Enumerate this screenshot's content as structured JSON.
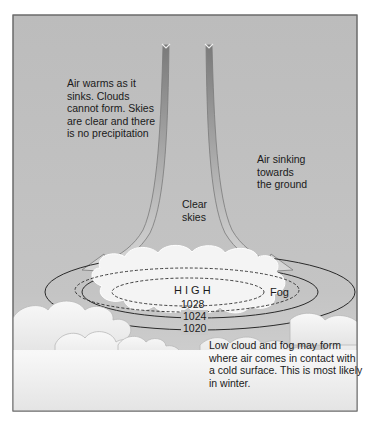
{
  "diagram": {
    "colors": {
      "sky_top": "#bcbcbc",
      "sky_bottom": "#d2d2d2",
      "frame": "#6a6a6a",
      "cloud": "#f6f6f6",
      "isobar": "#2a2a2a",
      "arrow": "#8a8a8a"
    },
    "labels": {
      "air_warms": "Air warms as it\nsinks. Clouds\ncannot form. Skies\nare clear and there\nis no precipitation",
      "air_sinking": "Air sinking\ntowards\nthe ground",
      "clear_skies": "Clear\nskies",
      "high": "H I G H",
      "fog": "Fog",
      "low_cloud": "Low cloud and fog may form\nwhere air comes in contact with\na cold surface. This is most likely\nin winter."
    },
    "isobars": [
      {
        "value": "1028",
        "style": "dashed"
      },
      {
        "value": "1024",
        "style": "solid"
      },
      {
        "value": "1020",
        "style": "solid"
      }
    ]
  }
}
